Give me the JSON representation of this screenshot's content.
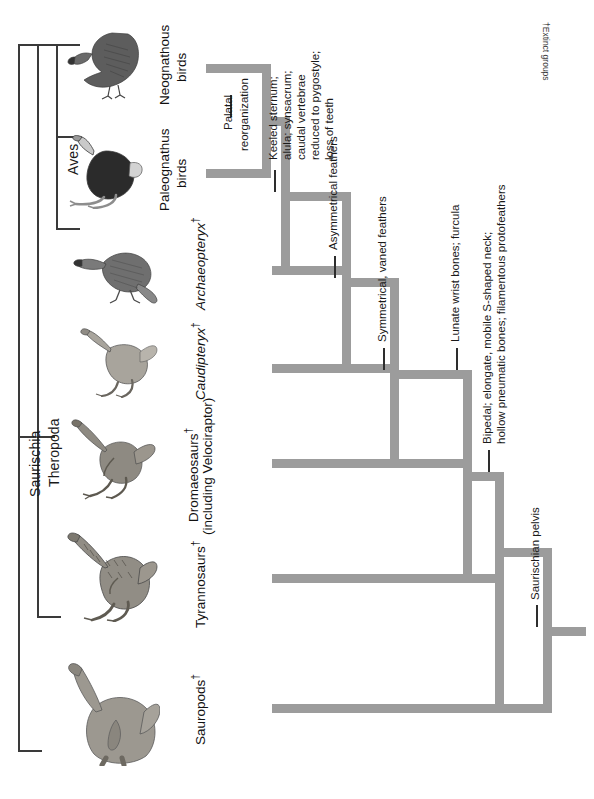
{
  "figure": {
    "type": "cladogram",
    "orientation": "rotated-90-counterclockwise",
    "footnote": "†Extinct groups"
  },
  "clades": [
    {
      "id": "saurischia",
      "label": "Saurischia"
    },
    {
      "id": "theropoda",
      "label": "Theropoda"
    },
    {
      "id": "aves",
      "label": "Aves"
    }
  ],
  "tips": [
    {
      "id": "neognathous-birds",
      "label": "Neognathous",
      "label2": "birds",
      "italic": false,
      "extinct": false,
      "icon": "hawk-illustration"
    },
    {
      "id": "paleognathus-birds",
      "label": "Paleognathus",
      "label2": "birds",
      "italic": false,
      "extinct": false,
      "icon": "ostrich-illustration"
    },
    {
      "id": "archaeopteryx",
      "label": "Archaeopteryx",
      "label2": "",
      "italic": true,
      "extinct": true,
      "icon": "archaeopteryx-illustration"
    },
    {
      "id": "caudipteryx",
      "label": "Caudipteryx",
      "label2": "",
      "italic": true,
      "extinct": true,
      "icon": "caudipteryx-illustration"
    },
    {
      "id": "dromaeosaurs",
      "label": "Dromaeosaurs",
      "label2": "(including Velociraptor)",
      "italic": false,
      "extinct": true,
      "icon": "dromaeosaur-illustration"
    },
    {
      "id": "tyrannosaurs",
      "label": "Tyrannosaurs",
      "label2": "",
      "italic": false,
      "extinct": true,
      "icon": "tyrannosaur-illustration"
    },
    {
      "id": "sauropods",
      "label": "Sauropods",
      "label2": "",
      "italic": false,
      "extinct": true,
      "icon": "sauropod-illustration"
    }
  ],
  "characters": [
    {
      "id": "palatal",
      "lines": [
        "Palatal",
        "reorganization"
      ]
    },
    {
      "id": "keeled",
      "lines": [
        "Keeled sternum;",
        "alula; synsacrum;",
        "caudal vertebrae",
        "reduced to pygostyle;",
        "loss of teeth"
      ]
    },
    {
      "id": "asymmetrical",
      "lines": [
        "Asymmetrical feathers"
      ]
    },
    {
      "id": "symmetrical",
      "lines": [
        "Symmetrical, vaned feathers"
      ]
    },
    {
      "id": "lunate",
      "lines": [
        "Lunate wrist bones; furcula"
      ]
    },
    {
      "id": "bipedal",
      "lines": [
        "Bipedal; elongate, mobile S-shaped neck;",
        "hollow pneumatic bones; filamentous protofeathers"
      ]
    },
    {
      "id": "pelvis",
      "lines": [
        "Saurischian pelvis"
      ]
    }
  ],
  "colors": {
    "branch": "#9c9c9c",
    "bracket": "#3a3a3a",
    "text": "#111111",
    "background": "#ffffff"
  }
}
